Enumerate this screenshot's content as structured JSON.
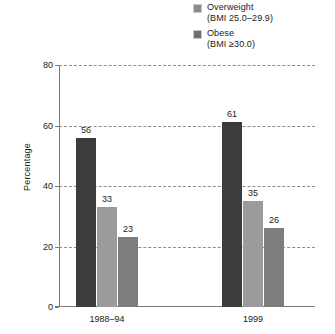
{
  "chart_data": {
    "type": "bar",
    "title": "",
    "xlabel": "",
    "ylabel": "Percentage",
    "ylim": [
      0,
      80
    ],
    "yticks": [
      "0",
      "20",
      "40",
      "60",
      "80"
    ],
    "grid": "horizontal-dashed",
    "legend_position": "top-right",
    "categories": [
      "1988–94",
      "1999"
    ],
    "series": [
      {
        "name": "bar-1",
        "values": [
          56,
          61
        ],
        "color": "#3c3c3c"
      },
      {
        "name": "bar-2",
        "values": [
          33,
          35
        ],
        "color": "#9b9b9b"
      },
      {
        "name": "bar-3",
        "values": [
          23,
          26
        ],
        "color": "#7d7d7d"
      }
    ]
  },
  "legend": {
    "entries": [
      {
        "label": "Overweight",
        "sub": "(BMI 25.0–29.9)",
        "color": "#8a8a8a"
      },
      {
        "label": "Obese",
        "sub": "(BMI ≥30.0)",
        "color": "#6f6f6f"
      }
    ]
  },
  "axis": {
    "y_title": "Percentage",
    "ticks": [
      {
        "value": "80"
      },
      {
        "value": "60"
      },
      {
        "value": "40"
      },
      {
        "value": "20"
      },
      {
        "value": "0"
      }
    ]
  },
  "groups": [
    {
      "label": "1988–94",
      "bars": [
        {
          "value": "56",
          "color": "#3c3c3c"
        },
        {
          "value": "33",
          "color": "#9b9b9b"
        },
        {
          "value": "23",
          "color": "#7d7d7d"
        }
      ]
    },
    {
      "label": "1999",
      "bars": [
        {
          "value": "61",
          "color": "#3c3c3c"
        },
        {
          "value": "35",
          "color": "#9b9b9b"
        },
        {
          "value": "26",
          "color": "#7d7d7d"
        }
      ]
    }
  ]
}
